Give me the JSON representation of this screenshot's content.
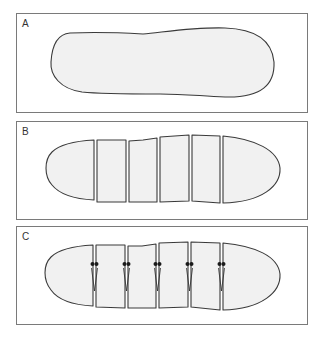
{
  "figure": {
    "panels": [
      {
        "id": "A",
        "label": "A",
        "description": "Intact elongated body outline",
        "segments": 1,
        "connectors": 0
      },
      {
        "id": "B",
        "label": "B",
        "description": "Body divided into separate segments",
        "segments": 6,
        "connectors": 0
      },
      {
        "id": "C",
        "label": "C",
        "description": "Segments joined by connectors",
        "segments": 6,
        "connectors": 5
      }
    ],
    "colors": {
      "fill": "#f1f1f1",
      "outline": "#3a3a3a",
      "frame": "#7a7a7a",
      "connector": "#1a1a1a"
    }
  }
}
